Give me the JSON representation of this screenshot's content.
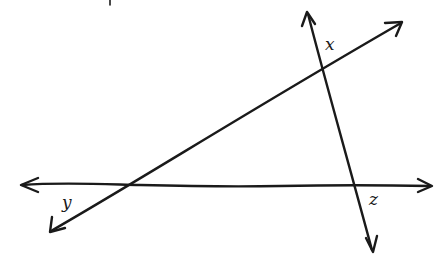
{
  "diagram": {
    "type": "intersecting-lines",
    "stroke_color": "#1a1a1a",
    "background": "#ffffff",
    "lines": [
      {
        "id": "horizontal-line",
        "from": [
          20,
          185
        ],
        "to": [
          432,
          186
        ],
        "arrows": "both"
      },
      {
        "id": "diagonal-line",
        "from": [
          50,
          232
        ],
        "to": [
          402,
          22
        ],
        "arrows": "both"
      },
      {
        "id": "steep-line",
        "from": [
          307,
          12
        ],
        "to": [
          373,
          252
        ],
        "arrows": "both"
      }
    ],
    "intersections": [
      {
        "id": "vertex-y",
        "point": [
          120,
          186
        ]
      },
      {
        "id": "vertex-x",
        "point": [
          321,
          70
        ]
      },
      {
        "id": "vertex-z",
        "point": [
          355,
          186
        ]
      }
    ],
    "labels": {
      "x": "x",
      "y": "y",
      "z": "z"
    }
  }
}
